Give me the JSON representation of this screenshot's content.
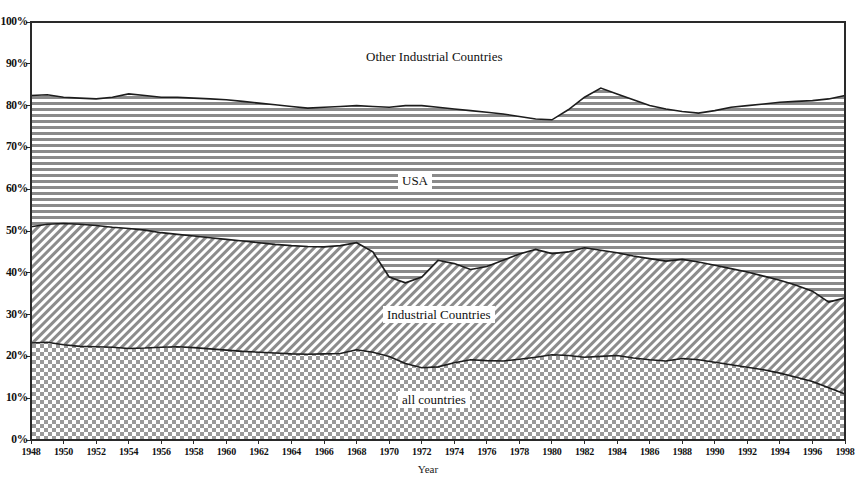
{
  "chart_data": {
    "type": "area",
    "stacked": true,
    "normalized": true,
    "title": "",
    "xlabel": "Year",
    "ylabel": "",
    "ylim": [
      0,
      100
    ],
    "xlim": [
      1948,
      1998
    ],
    "grid": false,
    "legend_position": "inline-annotations",
    "y_tick_labels": [
      "100%",
      "90%",
      "80%",
      "70%",
      "60%",
      "50%",
      "40%",
      "30%",
      "20%",
      "10%",
      "0%"
    ],
    "y_ticks": [
      100,
      90,
      80,
      70,
      60,
      50,
      40,
      30,
      20,
      10,
      0
    ],
    "x_tick_labels": [
      "1948",
      "1950",
      "1952",
      "1954",
      "1956",
      "1958",
      "1960",
      "1962",
      "1964",
      "1966",
      "1968",
      "1970",
      "1972",
      "1974",
      "1976",
      "1978",
      "1980",
      "1982",
      "1984",
      "1986",
      "1988",
      "1990",
      "1992",
      "1994",
      "1996",
      "1998"
    ],
    "x": [
      1948,
      1949,
      1950,
      1951,
      1952,
      1953,
      1954,
      1955,
      1956,
      1957,
      1958,
      1959,
      1960,
      1961,
      1962,
      1963,
      1964,
      1965,
      1966,
      1967,
      1968,
      1969,
      1970,
      1971,
      1972,
      1973,
      1974,
      1975,
      1976,
      1977,
      1978,
      1979,
      1980,
      1981,
      1982,
      1983,
      1984,
      1985,
      1986,
      1987,
      1988,
      1989,
      1990,
      1991,
      1992,
      1993,
      1994,
      1995,
      1996,
      1997,
      1998
    ],
    "series": [
      {
        "name": "all countries",
        "label": "all countries",
        "pattern": "checkerboard",
        "band": "bottom",
        "values": [
          23.2,
          23.4,
          22.8,
          22.4,
          22.3,
          22.2,
          21.9,
          22.0,
          22.2,
          22.3,
          22.1,
          21.8,
          21.5,
          21.2,
          21.0,
          20.8,
          20.6,
          20.5,
          20.6,
          20.7,
          21.6,
          21.0,
          20.0,
          18.3,
          17.3,
          17.5,
          18.5,
          19.2,
          19.0,
          18.9,
          19.3,
          19.8,
          20.4,
          20.2,
          19.8,
          20.0,
          20.2,
          19.6,
          19.2,
          18.9,
          19.5,
          19.2,
          18.6,
          18.0,
          17.4,
          16.8,
          16.0,
          15.0,
          14.0,
          12.5,
          11.0
        ]
      },
      {
        "name": "Industrial Countries",
        "label": "Industrial Countries",
        "pattern": "diagonal-hatch",
        "band": "middle",
        "cumulative_top": [
          51.0,
          51.6,
          51.8,
          51.6,
          51.3,
          50.9,
          50.6,
          50.2,
          49.6,
          49.2,
          48.8,
          48.4,
          48.0,
          47.6,
          47.2,
          46.8,
          46.5,
          46.3,
          46.2,
          46.5,
          47.2,
          45.0,
          39.0,
          37.6,
          39.0,
          43.0,
          42.2,
          40.8,
          41.5,
          43.0,
          44.5,
          45.6,
          44.6,
          45.0,
          46.0,
          45.4,
          44.8,
          44.0,
          43.4,
          42.8,
          43.2,
          42.6,
          41.8,
          41.0,
          40.2,
          39.2,
          38.2,
          37.0,
          35.6,
          33.0,
          34.0
        ]
      },
      {
        "name": "USA",
        "label": "USA",
        "pattern": "horizontal-lines",
        "band": "upper",
        "cumulative_top": [
          82.4,
          82.6,
          82.0,
          81.8,
          81.6,
          82.0,
          82.8,
          82.4,
          82.0,
          82.0,
          81.8,
          81.6,
          81.4,
          81.0,
          80.6,
          80.2,
          79.8,
          79.4,
          79.6,
          79.8,
          80.0,
          79.8,
          79.6,
          80.0,
          80.0,
          79.6,
          79.2,
          78.8,
          78.4,
          78.0,
          77.4,
          76.8,
          76.6,
          79.0,
          82.0,
          84.2,
          82.8,
          81.4,
          80.0,
          79.2,
          78.6,
          78.2,
          78.8,
          79.6,
          80.0,
          80.4,
          80.8,
          81.0,
          81.2,
          81.6,
          82.4
        ]
      },
      {
        "name": "Other Industrial Countries",
        "label": "Other Industrial Countries",
        "pattern": "white",
        "band": "top",
        "cumulative_top": [
          100,
          100,
          100,
          100,
          100,
          100,
          100,
          100,
          100,
          100,
          100,
          100,
          100,
          100,
          100,
          100,
          100,
          100,
          100,
          100,
          100,
          100,
          100,
          100,
          100,
          100,
          100,
          100,
          100,
          100,
          100,
          100,
          100,
          100,
          100,
          100,
          100,
          100,
          100,
          100,
          100,
          100,
          100,
          100,
          100,
          100,
          100,
          100,
          100,
          100,
          100
        ]
      }
    ]
  },
  "annotations": {
    "other_industrial": "Other Industrial Countries",
    "usa": "USA",
    "industrial": "Industrial Countries",
    "all_countries": "all countries"
  },
  "axis": {
    "x_title": "Year"
  }
}
